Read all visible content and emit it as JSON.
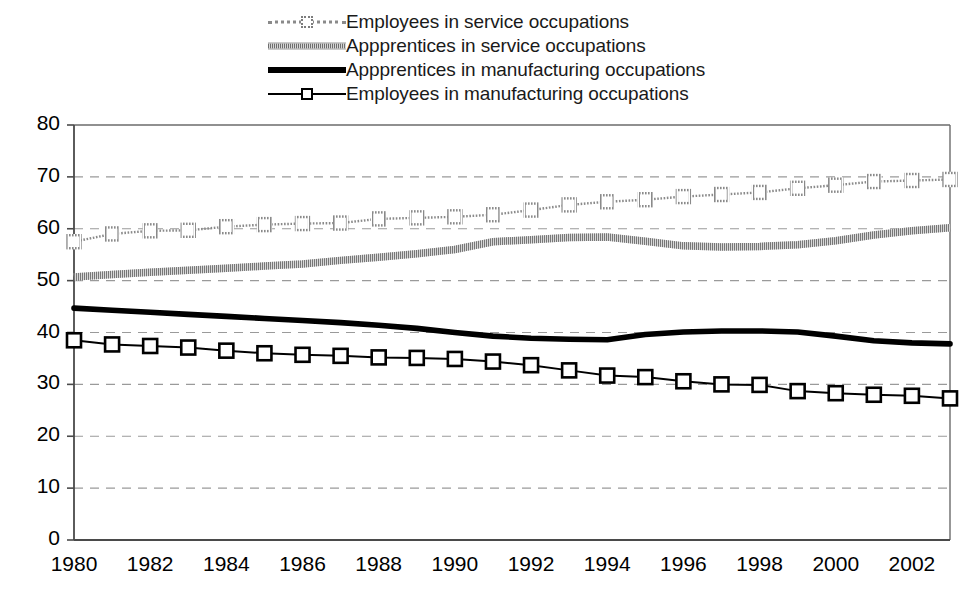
{
  "legend": {
    "position": "top-center",
    "entries": [
      {
        "label": "Employees in service occupations",
        "key": "dotted-line-open-square-marker",
        "color": "#8a8a8a"
      },
      {
        "label": "Appprentices in service occupations",
        "key": "thick-hatched-gray-line",
        "color": "#7a7a7a"
      },
      {
        "label": "Appprentices in manufacturing occupations",
        "key": "thick-black-line",
        "color": "#000000"
      },
      {
        "label": "Employees in manufacturing occupations",
        "key": "thin-black-line-open-square-marker",
        "color": "#000000"
      }
    ]
  },
  "axes": {
    "y_ticks": [
      "80",
      "70",
      "60",
      "50",
      "40",
      "30",
      "20",
      "10",
      "0"
    ],
    "x_ticks": [
      "1980",
      "1982",
      "1984",
      "1986",
      "1988",
      "1990",
      "1992",
      "1994",
      "1996",
      "1998",
      "2000",
      "2002"
    ]
  },
  "chart_data": {
    "type": "line",
    "title": "",
    "subtitle": "",
    "xlabel": "",
    "ylabel": "",
    "xlim": [
      1980,
      2003
    ],
    "ylim": [
      0,
      80
    ],
    "y_tick_step": 10,
    "x_tick_step": 2,
    "grid": "horizontal-dashed",
    "legend_position": "top-center",
    "x": [
      1980,
      1981,
      1982,
      1983,
      1984,
      1985,
      1986,
      1987,
      1988,
      1989,
      1990,
      1991,
      1992,
      1993,
      1994,
      1995,
      1996,
      1997,
      1998,
      1999,
      2000,
      2001,
      2002,
      2003
    ],
    "series": [
      {
        "name": "Employees in service occupations",
        "style": "dotted-with-open-square-markers",
        "color": "#8a8a8a",
        "values": [
          57.5,
          59.0,
          59.6,
          59.7,
          60.4,
          60.8,
          61.0,
          61.1,
          61.9,
          62.1,
          62.3,
          62.7,
          63.6,
          64.6,
          65.2,
          65.6,
          66.2,
          66.6,
          67.0,
          67.8,
          68.4,
          69.1,
          69.3,
          69.5
        ]
      },
      {
        "name": "Appprentices in service occupations",
        "style": "thick-hatched-gray",
        "color": "#7a7a7a",
        "values": [
          50.7,
          51.2,
          51.6,
          52.0,
          52.4,
          52.8,
          53.2,
          53.9,
          54.5,
          55.2,
          56.0,
          57.5,
          57.9,
          58.3,
          58.4,
          57.6,
          56.7,
          56.5,
          56.6,
          56.9,
          57.7,
          58.8,
          59.6,
          60.2
        ]
      },
      {
        "name": "Appprentices in manufacturing occupations",
        "style": "thick-black",
        "color": "#000000",
        "values": [
          44.7,
          44.3,
          43.9,
          43.5,
          43.1,
          42.7,
          42.3,
          41.9,
          41.4,
          40.8,
          40.0,
          39.3,
          38.9,
          38.7,
          38.6,
          39.6,
          40.1,
          40.3,
          40.3,
          40.1,
          39.3,
          38.4,
          38.0,
          37.8
        ]
      },
      {
        "name": "Employees in manufacturing occupations",
        "style": "thin-black-with-open-square-markers",
        "color": "#000000",
        "values": [
          38.5,
          37.7,
          37.4,
          37.1,
          36.5,
          36.0,
          35.7,
          35.5,
          35.2,
          35.1,
          34.9,
          34.4,
          33.7,
          32.7,
          31.7,
          31.4,
          30.6,
          30.0,
          29.9,
          28.7,
          28.3,
          28.0,
          27.8,
          27.3
        ]
      }
    ]
  }
}
